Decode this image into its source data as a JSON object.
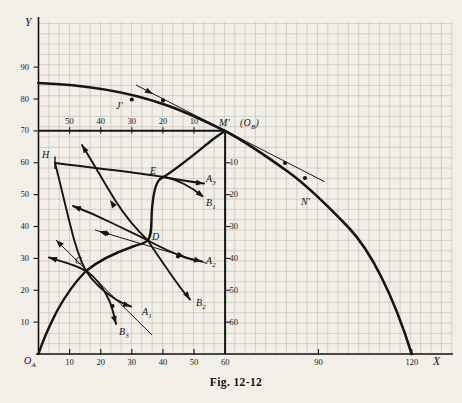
{
  "figure": {
    "caption": "Fig. 12-12"
  },
  "colors": {
    "paper": "#f1efe8",
    "grid": "#b9b6ac",
    "ink": "#151515"
  },
  "axes": {
    "x": {
      "label": "X",
      "ticks": [
        10,
        20,
        30,
        40,
        50,
        60,
        90,
        120
      ]
    },
    "y": {
      "label": "Y",
      "ticks": [
        10,
        20,
        30,
        40,
        50,
        60,
        70,
        80,
        90
      ]
    },
    "inner_top": {
      "ticks": [
        {
          "label": "50",
          "at_x": 10
        },
        {
          "label": "40",
          "at_x": 20
        },
        {
          "label": "30",
          "at_x": 30
        },
        {
          "label": "20",
          "at_x": 40
        },
        {
          "label": "10",
          "at_x": 50
        }
      ]
    },
    "inner_right": {
      "ticks": [
        {
          "label": "10",
          "at_y": 60
        },
        {
          "label": "20",
          "at_y": 50
        },
        {
          "label": "30",
          "at_y": 40
        },
        {
          "label": "40",
          "at_y": 30
        },
        {
          "label": "50",
          "at_y": 20
        },
        {
          "label": "60",
          "at_y": 10
        }
      ]
    }
  },
  "labels": [
    {
      "name": "origin-a-label",
      "base": "O",
      "sub": "A",
      "px": [
        24,
        355
      ]
    },
    {
      "name": "axis-y-letter",
      "base": "Y",
      "px": [
        25,
        16
      ]
    },
    {
      "name": "axis-x-letter",
      "base": "X",
      "px": [
        433,
        355
      ]
    },
    {
      "name": "point-label-h",
      "base": "H",
      "px": [
        42,
        149
      ]
    },
    {
      "name": "point-label-c",
      "base": "C",
      "px": [
        75,
        255
      ]
    },
    {
      "name": "point-label-d",
      "base": "D",
      "px": [
        152,
        231
      ]
    },
    {
      "name": "point-label-e",
      "base": "E",
      "px": [
        150,
        165
      ]
    },
    {
      "name": "point-label-j",
      "base": "J′",
      "px": [
        116,
        100
      ]
    },
    {
      "name": "point-label-m",
      "base": "M′",
      "px": [
        219,
        117
      ]
    },
    {
      "name": "origin-b-label",
      "pre": "(",
      "base": "O",
      "sub": "B",
      "post": ")",
      "px": [
        240,
        117
      ]
    },
    {
      "name": "point-label-n",
      "base": "N′",
      "px": [
        301,
        196
      ]
    },
    {
      "name": "curve-label-a1",
      "base": "A",
      "sub": "1",
      "px": [
        142,
        306
      ]
    },
    {
      "name": "curve-label-a2",
      "base": "A",
      "sub": "2",
      "px": [
        206,
        255
      ]
    },
    {
      "name": "curve-label-a3",
      "base": "A",
      "sub": "3",
      "px": [
        206,
        173
      ]
    },
    {
      "name": "curve-label-b1",
      "base": "B",
      "sub": "1",
      "px": [
        206,
        197
      ]
    },
    {
      "name": "curve-label-b2",
      "base": "B",
      "sub": "2",
      "px": [
        196,
        297
      ]
    },
    {
      "name": "curve-label-b3",
      "base": "B",
      "sub": "3",
      "px": [
        119,
        326
      ]
    }
  ],
  "annotations": {
    "arrows": [
      {
        "name": "price-line-m-arrow",
        "px": [
          153,
          94
        ],
        "angle": 28
      },
      {
        "name": "price-line-c-end-arrow",
        "px": [
          56,
          240
        ],
        "angle": 224.7
      },
      {
        "name": "curve-b3-left-end-arrow",
        "px": [
          49,
          257.5
        ],
        "angle": 197
      },
      {
        "name": "curve-a1-end-arrow",
        "px": [
          131,
          306.5
        ],
        "angle": 18
      },
      {
        "name": "curve-b3-end-arrow",
        "px": [
          116,
          324
        ],
        "angle": 74
      },
      {
        "name": "curve-a2-upper-mid-arrow",
        "px": [
          110,
          200
        ],
        "angle": 236
      },
      {
        "name": "curve-a2-upper-end-arrow",
        "px": [
          82,
          145
        ],
        "angle": 239
      },
      {
        "name": "curve-b2-left-end-arrow",
        "px": [
          73,
          206
        ],
        "angle": 202
      },
      {
        "name": "price-line-d-end-arrow",
        "px": [
          99,
          231.2
        ],
        "angle": 196.5
      },
      {
        "name": "price-line-d-mid-arrow",
        "px": [
          185,
          256.7
        ],
        "angle": 16.5
      },
      {
        "name": "curve-a2-end-arrow",
        "px": [
          202,
          261.5
        ],
        "angle": 14
      },
      {
        "name": "curve-b2-end-arrow",
        "px": [
          190,
          299.5
        ],
        "angle": 55
      },
      {
        "name": "curve-a3-end-arrow",
        "px": [
          204,
          183.5
        ],
        "angle": 7
      },
      {
        "name": "curve-b1-end-arrow",
        "px": [
          204,
          197
        ],
        "angle": 35
      }
    ],
    "dots": [
      {
        "name": "price-line-m-dot-upper",
        "px": [
          163,
          100.4
        ]
      },
      {
        "name": "price-line-m-dot-lower",
        "px": [
          285,
          163
        ]
      },
      {
        "name": "point-j-dot",
        "px": [
          131.8,
          99.5
        ]
      },
      {
        "name": "point-n-dot",
        "px": [
          305,
          178
        ]
      },
      {
        "name": "price-line-d-dot",
        "px": [
          107,
          233.6
        ]
      },
      {
        "name": "curve-b3-dot",
        "px": [
          112.5,
          306
        ]
      },
      {
        "name": "curve-a2-dot",
        "px": [
          178,
          256.5
        ]
      }
    ]
  },
  "chart_data": {
    "type": "line",
    "title": "Fig. 12-12",
    "xlabel": "X",
    "ylabel": "Y",
    "xlim": [
      0,
      133
    ],
    "ylim": [
      0,
      105
    ],
    "grid": true,
    "series": [
      {
        "name": "transformation-curve",
        "points": [
          [
            0,
            85
          ],
          [
            20,
            83.5
          ],
          [
            40,
            78.5
          ],
          [
            60,
            70
          ],
          [
            80,
            57.5
          ],
          [
            90,
            49.5
          ],
          [
            100,
            39.5
          ],
          [
            110,
            25
          ],
          [
            120,
            0
          ]
        ]
      },
      {
        "name": "contract-curve",
        "points": [
          [
            0,
            0
          ],
          [
            5,
            11
          ],
          [
            15,
            26
          ],
          [
            25,
            31
          ],
          [
            35,
            35.5
          ],
          [
            36.5,
            45
          ],
          [
            38,
            51
          ],
          [
            40,
            55.5
          ],
          [
            50,
            63
          ],
          [
            60,
            70
          ]
        ]
      },
      {
        "name": "indifference-A1",
        "points": [
          [
            5,
            60
          ],
          [
            8,
            48
          ],
          [
            12,
            34
          ],
          [
            15,
            26
          ],
          [
            21,
            21
          ],
          [
            26,
            16.6
          ],
          [
            30,
            15
          ]
        ]
      },
      {
        "name": "indifference-A2",
        "points": [
          [
            14,
            65.5
          ],
          [
            21,
            50
          ],
          [
            28,
            42
          ],
          [
            35,
            35.6
          ],
          [
            44,
            31.5
          ],
          [
            52.6,
            29
          ]
        ]
      },
      {
        "name": "indifference-A3",
        "points": [
          [
            40.2,
            55.5
          ],
          [
            47,
            53.7
          ],
          [
            53.2,
            53.5
          ]
        ]
      },
      {
        "name": "indifference-B1",
        "points": [
          [
            5.3,
            60
          ],
          [
            27.8,
            57.4
          ],
          [
            40.2,
            55.5
          ],
          [
            47,
            52
          ],
          [
            52.6,
            49.6
          ]
        ]
      },
      {
        "name": "indifference-B2",
        "points": [
          [
            11,
            46.4
          ],
          [
            24,
            41
          ],
          [
            35.2,
            35.6
          ],
          [
            42,
            27
          ],
          [
            48.7,
            17.1
          ]
        ]
      },
      {
        "name": "indifference-B3",
        "points": [
          [
            3.4,
            30.3
          ],
          [
            11,
            28.5
          ],
          [
            15,
            26
          ],
          [
            20,
            21
          ],
          [
            25,
            9.4
          ]
        ]
      },
      {
        "name": "price-line-M",
        "points": [
          [
            31.3,
            84.4
          ],
          [
            60,
            70
          ],
          [
            92,
            54
          ]
        ]
      },
      {
        "name": "price-line-C",
        "points": [
          [
            5.6,
            35.8
          ],
          [
            15.3,
            26.3
          ],
          [
            36.5,
            5.9
          ]
        ]
      },
      {
        "name": "price-line-D",
        "points": [
          [
            18.2,
            39
          ],
          [
            35.4,
            33.7
          ],
          [
            53.9,
            29.5
          ]
        ]
      }
    ],
    "points_of_interest": {
      "O_A": [
        0,
        0
      ],
      "H": [
        5.3,
        60
      ],
      "C": [
        15.3,
        26
      ],
      "D": [
        35.2,
        35.6
      ],
      "E": [
        40.2,
        55.5
      ],
      "M_prime_O_B": [
        60,
        70
      ],
      "J_prime": [
        30,
        80.5
      ],
      "N_prime": [
        86,
        49.5
      ]
    }
  }
}
